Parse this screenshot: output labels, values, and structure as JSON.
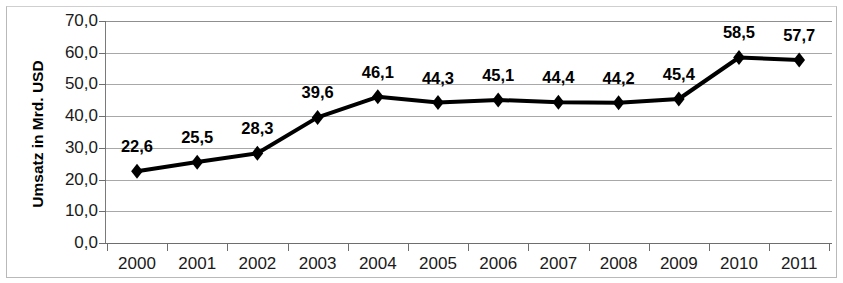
{
  "chart_data": {
    "type": "line",
    "title": "",
    "subtitle": "",
    "xlabel": "",
    "ylabel": "Umsatz in Mrd. USD",
    "categories": [
      "2000",
      "2001",
      "2002",
      "2003",
      "2004",
      "2005",
      "2006",
      "2007",
      "2008",
      "2009",
      "2010",
      "2011"
    ],
    "values": [
      22.6,
      25.5,
      28.3,
      39.6,
      46.1,
      44.3,
      45.1,
      44.4,
      44.2,
      45.4,
      58.5,
      57.7
    ],
    "data_labels": [
      "22,6",
      "25,5",
      "28,3",
      "39,6",
      "46,1",
      "44,3",
      "45,1",
      "44,4",
      "44,2",
      "45,4",
      "58,5",
      "57,7"
    ],
    "ylim": [
      0,
      70
    ],
    "ytick_values": [
      0,
      10,
      20,
      30,
      40,
      50,
      60,
      70
    ],
    "ytick_labels": [
      "0,0",
      "10,0",
      "20,0",
      "30,0",
      "40,0",
      "50,0",
      "60,0",
      "70,0"
    ],
    "grid": true,
    "grid_axis": "y",
    "legend": false,
    "legend_position": "none",
    "series_color": "#000000",
    "marker": "diamond",
    "line_width": 4,
    "decimal_separator": ","
  }
}
